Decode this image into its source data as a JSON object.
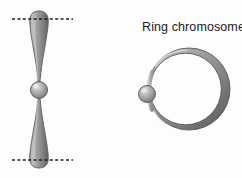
{
  "figure": {
    "width": 242,
    "height": 178,
    "background_color": "#fdfdfd",
    "type": "biology-illustration"
  },
  "labels": {
    "ring_chromosome": "Ring chromosome"
  },
  "colors": {
    "arm_light": "#b9b9b9",
    "arm_mid": "#9a9a9a",
    "arm_dark": "#6f6f6f",
    "arm_outline": "#5d5d5d",
    "centromere_highlight": "#dcdcdc",
    "centromere_mid": "#9d9d9d",
    "centromere_dark": "#6a6a6a",
    "centromere_outline": "#575757",
    "ring_light": "#bdbdbd",
    "ring_mid": "#8f8f8f",
    "ring_dark": "#666666",
    "ring_outline": "#5a5a5a",
    "dashed_line": "#1d1d1d",
    "text": "#1b1b1b"
  },
  "linear_chromosome": {
    "name": "metacentric chromosome",
    "center_x": 39,
    "centromere_y": 90,
    "top_tip_y": 11,
    "bottom_tip_y": 168,
    "max_arm_half_width": 9.5,
    "centromere_radius": 8.5,
    "upper_arm": {
      "name": "upper-arm",
      "from_y": 11,
      "to_y": 84
    },
    "lower_arm": {
      "name": "lower-arm",
      "from_y": 96,
      "to_y": 168
    }
  },
  "breakpoint_lines": [
    {
      "name": "top-breakpoint-line",
      "y": 19,
      "x_start": 12,
      "x_end": 73,
      "dash": "3 2.4",
      "width": 1.7
    },
    {
      "name": "bottom-breakpoint-line",
      "y": 160,
      "x_start": 12,
      "x_end": 73,
      "dash": "3 2.4",
      "width": 1.7
    }
  ],
  "ring_chromosome": {
    "name": "ring-chromosome",
    "center_x": 189,
    "center_y": 89,
    "radius_x": 41,
    "radius_y": 41,
    "tube_thick_right": 11,
    "tube_thin_left": 4,
    "centromere": {
      "cx": 147,
      "cy": 94,
      "r": 8.5
    }
  }
}
